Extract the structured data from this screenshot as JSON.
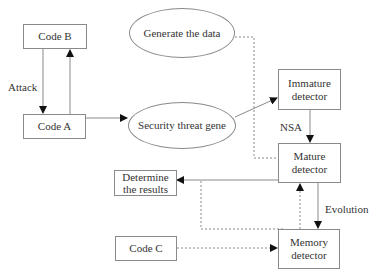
{
  "diagram": {
    "nodes": {
      "code_b": {
        "label": "Code B"
      },
      "code_a": {
        "label": "Code A"
      },
      "generate": {
        "label": "Generate the data"
      },
      "security": {
        "label": "Security threat gene"
      },
      "immature": {
        "label": "Immature\ndetector",
        "line1": "Immature",
        "line2": "detector"
      },
      "mature": {
        "label": "Mature\ndetector",
        "line1": "Mature",
        "line2": "detector"
      },
      "determine": {
        "label": "Determine\nthe results",
        "line1": "Determine",
        "line2": "the results"
      },
      "code_c": {
        "label": "Code C"
      },
      "memory": {
        "label": "Memory\ndetector",
        "line1": "Memory",
        "line2": "detector"
      }
    },
    "edge_labels": {
      "attack": "Attack",
      "nsa": "NSA",
      "evolution": "Evolution"
    },
    "edges": [
      {
        "from": "Code B",
        "to": "Code A",
        "style": "solid",
        "label": "Attack"
      },
      {
        "from": "Code A",
        "to": "Code B",
        "style": "solid"
      },
      {
        "from": "Code A",
        "to": "Security threat gene",
        "style": "solid"
      },
      {
        "from": "Security threat gene",
        "to": "Immature detector",
        "style": "solid"
      },
      {
        "from": "Generate the data",
        "to": "Mature detector",
        "style": "dashed"
      },
      {
        "from": "Immature detector",
        "to": "Mature detector",
        "style": "solid",
        "label": "NSA"
      },
      {
        "from": "Mature detector",
        "to": "Determine the results",
        "style": "solid"
      },
      {
        "from": "Mature detector",
        "to": "Memory detector",
        "style": "solid",
        "label": "Evolution"
      },
      {
        "from": "Memory detector",
        "to": "Mature detector",
        "style": "dashed"
      },
      {
        "from": "Memory detector",
        "to": "Determine the results",
        "style": "dashed"
      },
      {
        "from": "Code C",
        "to": "Memory detector",
        "style": "dashed"
      }
    ]
  }
}
